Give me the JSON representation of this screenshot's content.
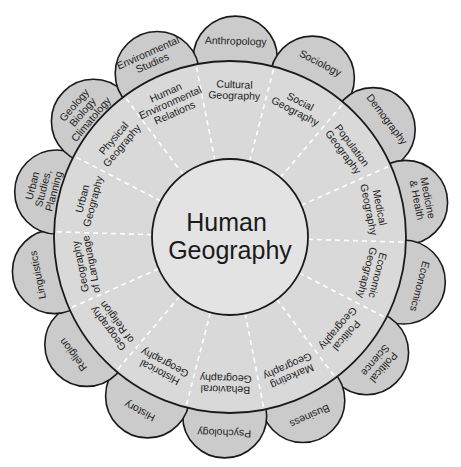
{
  "title": {
    "lines": [
      "Human",
      "Geography"
    ]
  },
  "colors": {
    "background": "#ffffff",
    "petal_fill": "#cbcbcb",
    "ring_fill": "#d9d9d9",
    "hub_fill": "#e3e3e3",
    "outline": "#1a1a1a",
    "divider": "#ffffff"
  },
  "geometry": {
    "center": [
      230,
      237
    ],
    "ring_radius": 176,
    "hub_radius": 78,
    "petal_center_radius": 179,
    "petal_radius": 42,
    "first_sector_angle_deg": 88.3,
    "sector_count": 14
  },
  "sectors": [
    {
      "subfield": [
        "Cultural",
        "Geography"
      ],
      "discipline": [
        "Anthropology"
      ]
    },
    {
      "subfield": [
        "Social",
        "Geography"
      ],
      "discipline": [
        "Sociology"
      ]
    },
    {
      "subfield": [
        "Population",
        "Geography"
      ],
      "discipline": [
        "Demography"
      ]
    },
    {
      "subfield": [
        "Medical",
        "Geography"
      ],
      "discipline": [
        "Medicine",
        "& Health"
      ]
    },
    {
      "subfield": [
        "Economic",
        "Geography"
      ],
      "discipline": [
        "Economics"
      ]
    },
    {
      "subfield": [
        "Political",
        "Geography"
      ],
      "discipline": [
        "Political",
        "Science"
      ]
    },
    {
      "subfield": [
        "Marketing",
        "Geography"
      ],
      "discipline": [
        "Business"
      ]
    },
    {
      "subfield": [
        "Behavioral",
        "Geography"
      ],
      "discipline": [
        "Psychology"
      ]
    },
    {
      "subfield": [
        "Historical",
        "Geography"
      ],
      "discipline": [
        "History"
      ]
    },
    {
      "subfield": [
        "Geography",
        "of Religion"
      ],
      "discipline": [
        "Religion"
      ]
    },
    {
      "subfield": [
        "Geography",
        "of Language"
      ],
      "discipline": [
        "Linguistics"
      ]
    },
    {
      "subfield": [
        "Urban",
        "Geography"
      ],
      "discipline": [
        "Urban",
        "Studies,",
        "Planning"
      ]
    },
    {
      "subfield": [
        "Physical",
        "Geography"
      ],
      "discipline": [
        "Geology",
        "Biology",
        "Climatology"
      ]
    },
    {
      "subfield": [
        "Human",
        "Environmental",
        "Relations"
      ],
      "discipline": [
        "Environmental",
        "Studies"
      ]
    }
  ]
}
